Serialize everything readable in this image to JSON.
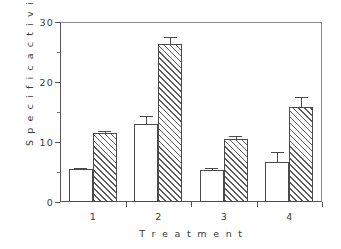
{
  "chart_data": {
    "type": "bar",
    "title": "",
    "xlabel": "T r e a t m e n t",
    "ylabel": "S p e c i f i c   a c t i v i t y",
    "categories": [
      "1",
      "2",
      "3",
      "4"
    ],
    "xtick_labels": [
      "1",
      "2",
      "3",
      "4"
    ],
    "ytick_labels": [
      "0",
      "10",
      "20",
      "30"
    ],
    "ytick_values": [
      0,
      10,
      20,
      30
    ],
    "yminor_values": [
      5,
      15,
      25
    ],
    "ylim": [
      0,
      30
    ],
    "grid": false,
    "legend": "none",
    "series": [
      {
        "name": "open",
        "fill": "white",
        "values": [
          5.5,
          13.0,
          5.4,
          6.7
        ],
        "errors": [
          0.25,
          1.4,
          0.25,
          1.6
        ]
      },
      {
        "name": "hatched",
        "fill": "diagonal-hatch",
        "values": [
          11.5,
          26.3,
          10.5,
          15.8
        ],
        "errors": [
          0.35,
          1.2,
          0.5,
          1.7
        ]
      }
    ]
  },
  "axis": {
    "ylabel_text": "Specific activity",
    "xlabel_text": "Treatment"
  },
  "colors": {
    "frame": "#555555",
    "bar_edge": "#4a4a4a",
    "hatch": "#5a5a5a",
    "text": "#3a3a3a",
    "background": "#ffffff"
  }
}
